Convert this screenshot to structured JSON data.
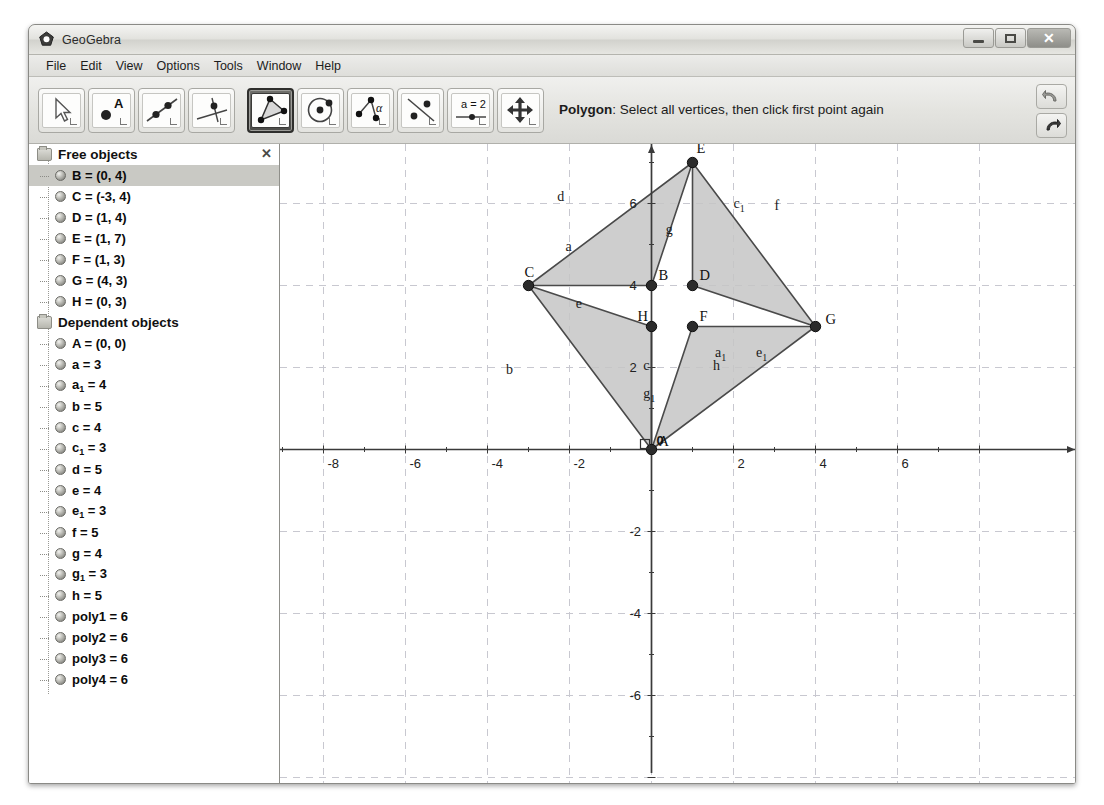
{
  "window": {
    "title": "GeoGebra",
    "app_icon": "geogebra-logo-icon",
    "controls": {
      "minimize": "minimize-icon",
      "maximize": "maximize-icon",
      "close": "close-icon"
    }
  },
  "menubar": {
    "items": [
      "File",
      "Edit",
      "View",
      "Options",
      "Tools",
      "Window",
      "Help"
    ]
  },
  "toolbar": {
    "buttons": [
      {
        "name": "move-tool",
        "icon": "arrow-cursor-icon",
        "active": false
      },
      {
        "name": "point-tool",
        "icon": "point-a-icon",
        "active": false
      },
      {
        "name": "line-tool",
        "icon": "line-through-two-points-icon",
        "active": false
      },
      {
        "name": "perpendicular-line-tool",
        "icon": "perpendicular-line-icon",
        "active": false
      },
      {
        "name": "polygon-tool",
        "icon": "polygon-icon",
        "active": true
      },
      {
        "name": "circle-tool",
        "icon": "circle-icon",
        "active": false
      },
      {
        "name": "angle-tool",
        "icon": "angle-alpha-icon",
        "active": false
      },
      {
        "name": "reflect-tool",
        "icon": "reflect-about-line-icon",
        "active": false
      },
      {
        "name": "slider-tool",
        "icon": "slider-a-equals-2-icon",
        "active": false
      },
      {
        "name": "move-graphics-view-tool",
        "icon": "move-graphics-icon",
        "active": false
      }
    ],
    "help_title": "Polygon",
    "help_text": ": Select all vertices, then click first point again",
    "undo_icon": "undo-arrow-icon",
    "redo_icon": "redo-arrow-icon"
  },
  "sidebar": {
    "close_icon": "close-panel-icon",
    "groups": [
      {
        "title": "Free objects",
        "items": [
          {
            "label": "B = (0, 4)",
            "selected": true
          },
          {
            "label": "C = (-3, 4)",
            "selected": false
          },
          {
            "label": "D = (1, 4)",
            "selected": false
          },
          {
            "label": "E = (1, 7)",
            "selected": false
          },
          {
            "label": "F = (1, 3)",
            "selected": false
          },
          {
            "label": "G = (4, 3)",
            "selected": false
          },
          {
            "label": "H = (0, 3)",
            "selected": false
          }
        ]
      },
      {
        "title": "Dependent objects",
        "items": [
          {
            "label": "A = (0, 0)",
            "selected": false
          },
          {
            "label": "a = 3",
            "selected": false
          },
          {
            "label": "a",
            "sub": "1",
            "tail": " = 4",
            "selected": false
          },
          {
            "label": "b = 5",
            "selected": false
          },
          {
            "label": "c = 4",
            "selected": false
          },
          {
            "label": "c",
            "sub": "1",
            "tail": " = 3",
            "selected": false
          },
          {
            "label": "d = 5",
            "selected": false
          },
          {
            "label": "e = 4",
            "selected": false
          },
          {
            "label": "e",
            "sub": "1",
            "tail": " = 3",
            "selected": false
          },
          {
            "label": "f = 5",
            "selected": false
          },
          {
            "label": "g = 4",
            "selected": false
          },
          {
            "label": "g",
            "sub": "1",
            "tail": " = 3",
            "selected": false
          },
          {
            "label": "h = 5",
            "selected": false
          },
          {
            "label": "poly1 = 6",
            "selected": false
          },
          {
            "label": "poly2 = 6",
            "selected": false
          },
          {
            "label": "poly3 = 6",
            "selected": false
          },
          {
            "label": "poly4 = 6",
            "selected": false
          }
        ]
      }
    ]
  },
  "chart_data": {
    "type": "scatter",
    "title": "",
    "xlabel": "",
    "ylabel": "",
    "xlim": [
      -10.5,
      8.0
    ],
    "ylim": [
      -7.6,
      8.4
    ],
    "grid": true,
    "x_ticks": [
      -8,
      -6,
      -4,
      -2,
      0,
      2,
      4,
      6
    ],
    "y_ticks": [
      6,
      4,
      2,
      0,
      -2,
      -4,
      -6
    ],
    "origin_label": "0",
    "points": [
      {
        "label": "A",
        "x": 0,
        "y": 0
      },
      {
        "label": "B",
        "x": 0,
        "y": 4
      },
      {
        "label": "C",
        "x": -3,
        "y": 4
      },
      {
        "label": "D",
        "x": 1,
        "y": 4
      },
      {
        "label": "E",
        "x": 1,
        "y": 7
      },
      {
        "label": "F",
        "x": 1,
        "y": 3
      },
      {
        "label": "G",
        "x": 4,
        "y": 3
      },
      {
        "label": "H",
        "x": 0,
        "y": 3
      }
    ],
    "polygons": [
      {
        "name": "poly1",
        "vertices": [
          "C",
          "E",
          "B"
        ],
        "area": 6
      },
      {
        "name": "poly2",
        "vertices": [
          "E",
          "G",
          "D"
        ],
        "area": 6
      },
      {
        "name": "poly3",
        "vertices": [
          "G",
          "A",
          "F"
        ],
        "area": 6
      },
      {
        "name": "poly4",
        "vertices": [
          "A",
          "C",
          "H"
        ],
        "area": 6
      }
    ],
    "segment_labels": [
      {
        "label": "a",
        "x": -2.1,
        "y": 4.85
      },
      {
        "label": "a",
        "sub": "1",
        "x": 1.55,
        "y": 2.25
      },
      {
        "label": "b",
        "x": -3.55,
        "y": 1.85
      },
      {
        "label": "c",
        "x": -0.2,
        "y": 1.95
      },
      {
        "label": "c",
        "sub": "1",
        "x": 2.0,
        "y": 5.9
      },
      {
        "label": "d",
        "x": -2.3,
        "y": 6.05
      },
      {
        "label": "e",
        "x": -1.85,
        "y": 3.45
      },
      {
        "label": "e",
        "sub": "1",
        "x": 2.55,
        "y": 2.25
      },
      {
        "label": "f",
        "x": 3.0,
        "y": 5.85
      },
      {
        "label": "g",
        "x": 0.35,
        "y": 5.25
      },
      {
        "label": "g",
        "sub": "1",
        "x": -0.2,
        "y": 1.25
      },
      {
        "label": "h",
        "x": 1.5,
        "y": 1.95
      }
    ],
    "fill_color": "#c6c6c6",
    "stroke_color": "#4a4a4a",
    "grid_color": "#c8c8d0",
    "axis_color": "#3a3a3a"
  }
}
